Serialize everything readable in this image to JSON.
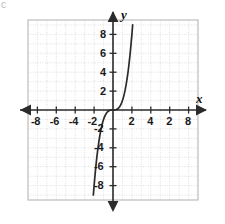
{
  "chart_data": {
    "type": "line",
    "title": "",
    "xlabel": "x",
    "ylabel": "y",
    "xlim": [
      -9,
      9
    ],
    "ylim": [
      -9.5,
      9.5
    ],
    "grid": true,
    "grid_step": 1,
    "legend": "none",
    "equation": "y = x^3",
    "x_tick_labels": [
      "-8",
      "-6",
      "-4",
      "-2",
      "2",
      "4",
      "2",
      "8"
    ],
    "x_tick_values": [
      -8,
      -6,
      -4,
      -2,
      2,
      4,
      6,
      8
    ],
    "y_tick_labels": [
      "8",
      "6",
      "4",
      "2",
      "-2",
      "-4",
      "-6",
      "-8"
    ],
    "y_tick_values": [
      8,
      6,
      4,
      2,
      -2,
      -4,
      -6,
      -8
    ],
    "series": [
      {
        "name": "y = x^3",
        "color": "#2b2b2b",
        "x": [
          -2.08,
          -2.0,
          -1.9,
          -1.8,
          -1.7,
          -1.6,
          -1.5,
          -1.4,
          -1.3,
          -1.2,
          -1.1,
          -1.0,
          -0.9,
          -0.8,
          -0.7,
          -0.6,
          -0.5,
          -0.4,
          -0.3,
          -0.2,
          -0.1,
          0.0,
          0.1,
          0.2,
          0.3,
          0.4,
          0.5,
          0.6,
          0.7,
          0.8,
          0.9,
          1.0,
          1.1,
          1.2,
          1.3,
          1.4,
          1.5,
          1.6,
          1.7,
          1.8,
          1.9,
          2.0,
          2.08
        ],
        "y": [
          -9.0,
          -8.0,
          -6.86,
          -5.83,
          -4.91,
          -4.1,
          -3.38,
          -2.74,
          -2.2,
          -1.73,
          -1.33,
          -1.0,
          -0.73,
          -0.51,
          -0.34,
          -0.22,
          -0.13,
          -0.06,
          -0.03,
          -0.01,
          0.0,
          0.0,
          0.0,
          0.01,
          0.03,
          0.06,
          0.13,
          0.22,
          0.34,
          0.51,
          0.73,
          1.0,
          1.33,
          1.73,
          2.2,
          2.74,
          3.38,
          4.1,
          4.91,
          5.83,
          6.86,
          8.0,
          9.0
        ]
      }
    ]
  },
  "axes": {
    "x_axis_label": "x",
    "y_axis_label": "y"
  },
  "colors": {
    "curve": "#2b2b2b",
    "axis": "#2b2b2b",
    "grid": "#d8d8d8",
    "frame": "#bdbdbd",
    "label": "#1b1b1b"
  },
  "artifacts": {
    "corner_mark": "c"
  }
}
